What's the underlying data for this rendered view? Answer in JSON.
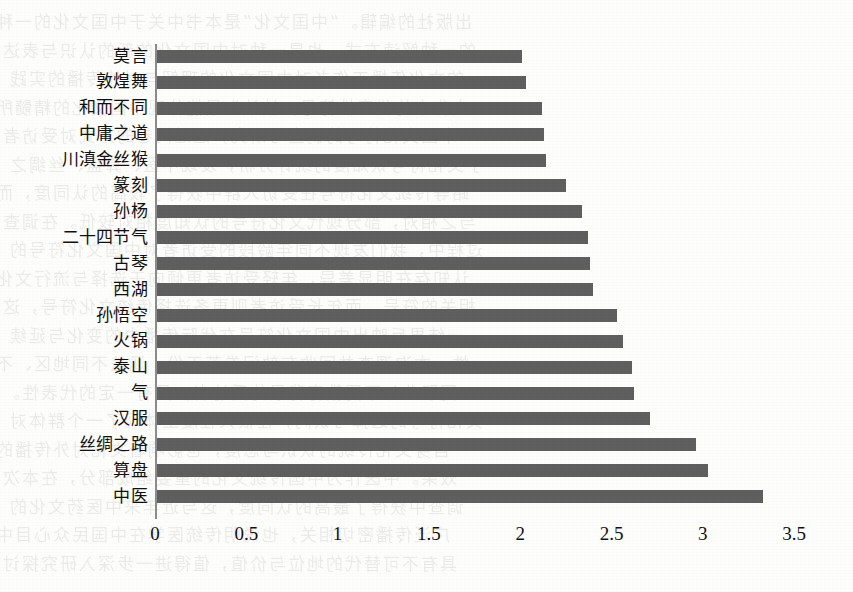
{
  "chart_data": {
    "type": "bar",
    "orientation": "horizontal",
    "title": "",
    "subtitle": "",
    "xlabel": "",
    "ylabel": "",
    "grid": false,
    "legend": null,
    "xlim": [
      0,
      3.5
    ],
    "xticks": [
      "0",
      "0.5",
      "1",
      "1.5",
      "2",
      "2.5",
      "3",
      "3.5"
    ],
    "xtick_values": [
      0,
      0.5,
      1,
      1.5,
      2,
      2.5,
      3,
      3.5
    ],
    "bar_color": "#5f5f5f",
    "categories": [
      "莫言",
      "敦煌舞",
      "和而不同",
      "中庸之道",
      "川滇金丝猴",
      "篆刻",
      "孙杨",
      "二十四节气",
      "古琴",
      "西湖",
      "孙悟空",
      "火锅",
      "泰山",
      "气",
      "汉服",
      "丝绸之路",
      "算盘",
      "中医"
    ],
    "values": [
      2.0,
      2.02,
      2.11,
      2.12,
      2.13,
      2.24,
      2.33,
      2.36,
      2.37,
      2.39,
      2.52,
      2.55,
      2.6,
      2.61,
      2.7,
      2.95,
      3.02,
      3.32
    ]
  },
  "background": {
    "show_through_lines": [
      "出版社的编辑。“中国文化”是本书中关于中国文化的一种",
      "的一种解读方式，也是一种对中国文化的新的认识与表达",
      "的文化传播工作者对中国文化的理解与对外传播的实践",
      "文化中的代表性符号，被认为最能体现中国文化的精髓所",
      "中国文化符号的调查与研究，通过问卷的方式对受访者",
      "了文化符号认知度的统计分析，发现中医、算盘、丝绸之",
      "路等传统文化符号在受访人群中获得了较高的认同度，而",
      "与之相对，部分现代文化符号的认知度相对较低。在调查",
      "过程中，我们发现不同年龄段的受访者对中国文化符号的",
      "认知存在明显差异，年轻受访者更倾向于选择与流行文化",
      "相关的符号，而年长受访者则更多选择传统文化符号，这",
      "一结果反映出中国文化符号在代际传播中的变化与延续",
      "性。本次调查共回收有效问卷若干份，涵盖不同地区、不",
      "同职业与不同教育背景的受访者，具有一定的代表性。",
      "文化符号的选择与认同，在很大程度上体现了一个群体对",
      "自身文化传统的认识与态度，也影响着文化对外传播的",
      "效果。中医作为中国传统文化的重要组成部分，在本次",
      "调查中获得了最高的认同度，这与近年来中医药文化的",
      "广泛传播密切相关，也说明传统医学在中国民众心目中",
      "具有不可替代的地位与价值，值得进一步深入研究探讨"
    ]
  }
}
